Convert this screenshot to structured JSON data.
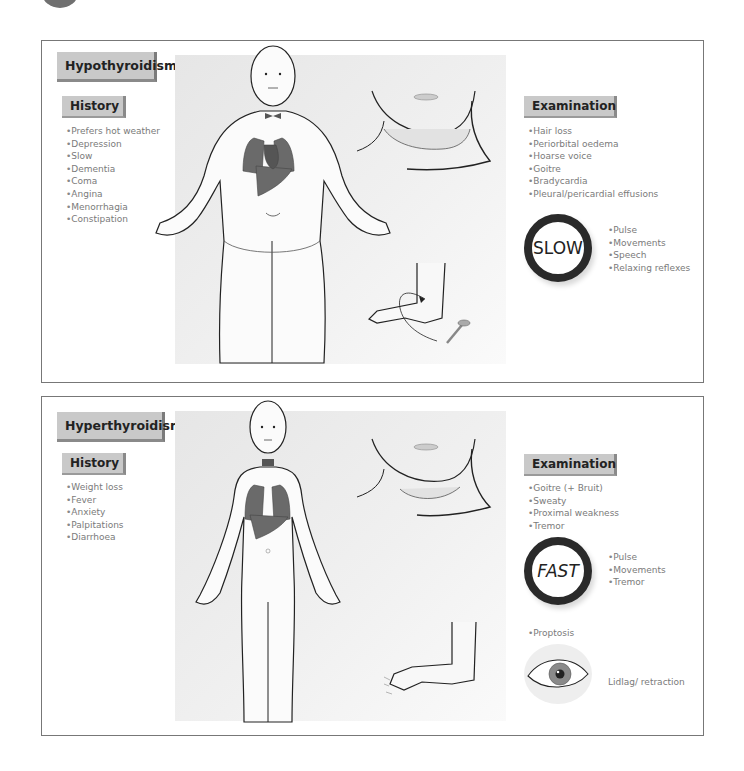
{
  "hypothyroidism": {
    "title": "Hypothyroidism",
    "history": {
      "header": "History",
      "items": [
        "Prefers hot weather",
        "Depression",
        "Slow",
        "Dementia",
        "Coma",
        "Angina",
        "Menorrhagia",
        "Constipation"
      ]
    },
    "examination": {
      "header": "Examination",
      "items": [
        "Hair loss",
        "Periorbital oedema",
        "Hoarse voice",
        "Goitre",
        "Bradycardia",
        "Pleural/pericardial effusions"
      ],
      "badge": "SLOW",
      "badge_items": [
        "Pulse",
        "Movements",
        "Speech",
        "Relaxing reflexes"
      ]
    }
  },
  "hyperthyroidism": {
    "title": "Hyperthyroidism",
    "history": {
      "header": "History",
      "items": [
        "Weight loss",
        "Fever",
        "Anxiety",
        "Palpitations",
        "Diarrhoea"
      ]
    },
    "examination": {
      "header": "Examination",
      "items": [
        "Goitre (+ Bruit)",
        "Sweaty",
        "Proximal weakness",
        "Tremor"
      ],
      "badge": "FAST",
      "badge_items": [
        "Pulse",
        "Movements",
        "Tremor"
      ],
      "extra_item": "Proptosis",
      "eye_label": "Lidlag/ retraction"
    }
  },
  "colors": {
    "panel_border": "#777777",
    "header_fill": "#c9c9c9",
    "organ": "#6a6a6a",
    "text": "#7a7a7a"
  }
}
